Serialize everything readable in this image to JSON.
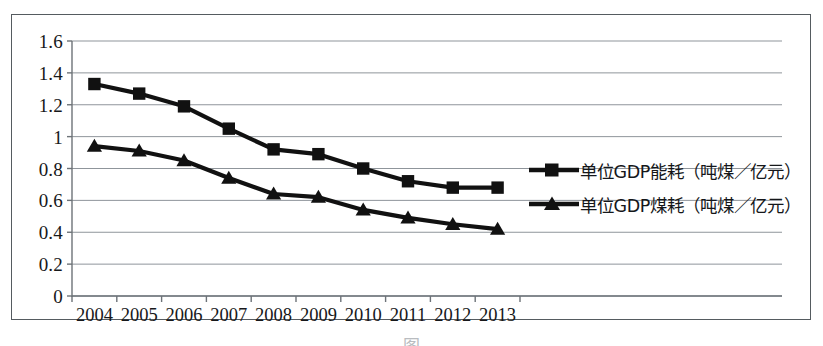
{
  "chart_data": {
    "type": "line",
    "title": "",
    "subtitle": "",
    "xlabel": "",
    "ylabel": "",
    "categories": [
      "2004",
      "2005",
      "2006",
      "2007",
      "2008",
      "2009",
      "2010",
      "2011",
      "2012",
      "2013"
    ],
    "series": [
      {
        "name": "单位GDP能耗（吨煤／亿元）",
        "marker": "square",
        "values": [
          1.33,
          1.27,
          1.19,
          1.05,
          0.92,
          0.89,
          0.8,
          0.72,
          0.68,
          0.68
        ]
      },
      {
        "name": "单位GDP煤耗（吨煤／亿元）",
        "marker": "triangle",
        "values": [
          0.94,
          0.91,
          0.85,
          0.74,
          0.64,
          0.62,
          0.54,
          0.49,
          0.45,
          0.42
        ]
      }
    ],
    "ylim": [
      0,
      1.6
    ],
    "yticks": [
      "0",
      "0.2",
      "0.4",
      "0.6",
      "0.8",
      "1",
      "1.2",
      "1.4",
      "1.6"
    ],
    "ytick_values": [
      0,
      0.2,
      0.4,
      0.6,
      0.8,
      1.0,
      1.2,
      1.4,
      1.6
    ],
    "grid": true,
    "grid_axis": "y",
    "legend_position": "right",
    "series_color": "#111111",
    "grid_color": "#8f959b",
    "axis_color": "#6d7378",
    "background": "#ffffff"
  },
  "legend": {
    "items": [
      {
        "label": "单位GDP能耗（吨煤／亿元）",
        "marker": "square-marker-icon"
      },
      {
        "label": "单位GDP煤耗（吨煤／亿元）",
        "marker": "triangle-marker-icon"
      }
    ]
  },
  "caption": {
    "text": "图"
  }
}
